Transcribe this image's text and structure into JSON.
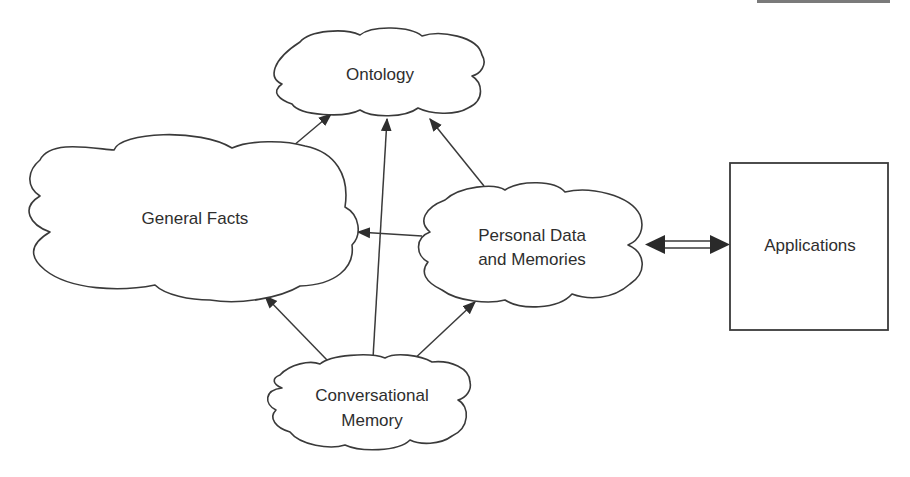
{
  "diagram": {
    "nodes": {
      "ontology": {
        "label_lines": [
          "Ontology"
        ],
        "shape": "cloud"
      },
      "general_facts": {
        "label_lines": [
          "General Facts"
        ],
        "shape": "cloud"
      },
      "personal_data": {
        "label_lines": [
          "Personal Data",
          "and Memories"
        ],
        "shape": "cloud"
      },
      "conversational_memory": {
        "label_lines": [
          "Conversational",
          "Memory"
        ],
        "shape": "cloud"
      },
      "applications": {
        "label_lines": [
          "Applications"
        ],
        "shape": "box"
      }
    },
    "edges": [
      {
        "from": "General Facts",
        "to": "Ontology",
        "type": "arrow"
      },
      {
        "from": "Conversational Memory",
        "to": "Ontology",
        "type": "arrow"
      },
      {
        "from": "Personal Data and Memories",
        "to": "Ontology",
        "type": "arrow"
      },
      {
        "from": "Personal Data and Memories",
        "to": "General Facts",
        "type": "arrow"
      },
      {
        "from": "Conversational Memory",
        "to": "General Facts",
        "type": "arrow"
      },
      {
        "from": "Conversational Memory",
        "to": "Personal Data and Memories",
        "type": "arrow"
      },
      {
        "from": "Personal Data and Memories",
        "to": "Applications",
        "type": "double-headed hollow arrow"
      }
    ],
    "colors": {
      "stroke": "#3a3a3a",
      "text": "#2e2e2e",
      "background": "#ffffff"
    }
  }
}
